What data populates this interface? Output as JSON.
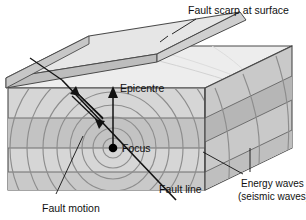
{
  "figure": {
    "kind": "earthquake-block-diagram",
    "background": "#ffffff"
  },
  "labels": {
    "fault_scarp": "Fault scarp at surface",
    "epicentre": "Epicentre",
    "focus": "Focus",
    "fault_line": "Fault line",
    "fault_motion": "Fault motion",
    "energy_waves_line1": "Energy waves",
    "energy_waves_line2": "(seismic waves)"
  },
  "colors": {
    "outline": "#4a4a4a",
    "top_face": "#ededed",
    "front_face": "#d6d6d6",
    "front_band": "#c3c3c3",
    "side_face": "#c9c9c9",
    "side_band": "#b6b6b6",
    "scarp_face": "#bdbdbd",
    "wave_stroke": "#8d8d8d",
    "focus_dot": "#000000",
    "text": "#101010",
    "leader": "#111111"
  },
  "elements": {
    "focus_point": {
      "x": 113,
      "y": 148
    },
    "epicentre_arrow": {
      "from_y": 148,
      "to_y": 90,
      "x": 113
    },
    "wave_rings": [
      10,
      20,
      31,
      43,
      56,
      70,
      86,
      103,
      122
    ],
    "strata_count_front": 3,
    "strata_count_side": 3
  }
}
